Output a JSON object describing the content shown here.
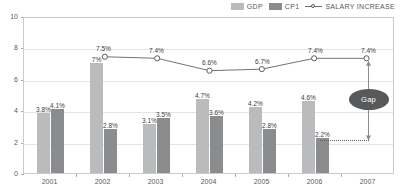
{
  "legend": {
    "items": [
      {
        "label": "GDP",
        "type": "bar",
        "color": "#b9bbbd"
      },
      {
        "label": "CP1",
        "type": "bar",
        "color": "#8a8c8e"
      },
      {
        "label": "SALARY INCREASE",
        "type": "line",
        "color": "#6e7073"
      }
    ]
  },
  "annotation": {
    "gap_label": "Gap"
  },
  "chart_data": {
    "type": "bar",
    "title": "",
    "xlabel": "",
    "ylabel": "",
    "categories": [
      "2001",
      "2002",
      "2003",
      "2004",
      "2005",
      "2006",
      "2007"
    ],
    "ylim": [
      0,
      10
    ],
    "yticks": [
      "0",
      "2",
      "4",
      "6",
      "8",
      "10"
    ],
    "grid": true,
    "legend_position": "top-right",
    "series": [
      {
        "name": "GDP",
        "type": "bar",
        "color": "#b9bbbd",
        "values": [
          3.8,
          7.0,
          3.1,
          4.7,
          4.2,
          4.6,
          null
        ],
        "labels": [
          "3.8%",
          "7%",
          "3.1%",
          "4.7%",
          "4.2%",
          "4.6%",
          ""
        ]
      },
      {
        "name": "CP1",
        "type": "bar",
        "color": "#8a8c8e",
        "values": [
          4.1,
          2.8,
          3.5,
          3.6,
          2.8,
          2.2,
          null
        ],
        "labels": [
          "4.1%",
          "2.8%",
          "3.5%",
          "3.6%",
          "2.8%",
          "2.2%",
          ""
        ]
      },
      {
        "name": "SALARY INCREASE",
        "type": "line",
        "color": "#6e7073",
        "values": [
          null,
          7.5,
          7.4,
          6.6,
          6.7,
          7.4,
          7.4
        ],
        "labels": [
          "",
          "7.5%",
          "7.4%",
          "6.6%",
          "6.7%",
          "7.4%",
          "7.4%"
        ]
      }
    ],
    "annotations": [
      {
        "text": "Gap",
        "from": 7.4,
        "to": 2.2,
        "at_category": "2007"
      }
    ]
  }
}
